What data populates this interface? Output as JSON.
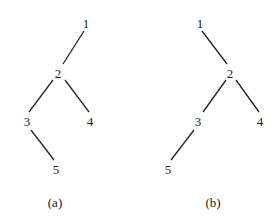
{
  "figure": {
    "trees": [
      {
        "caption": "(a)",
        "nodes": [
          {
            "id": "1",
            "label": "1",
            "x": 86,
            "y": 23
          },
          {
            "id": "2",
            "label": "2",
            "x": 58,
            "y": 73
          },
          {
            "id": "3",
            "label": "3",
            "x": 27,
            "y": 121
          },
          {
            "id": "4",
            "label": "4",
            "x": 90,
            "y": 121
          },
          {
            "id": "5",
            "label": "5",
            "x": 56,
            "y": 169
          }
        ],
        "edges": [
          [
            "1",
            "2"
          ],
          [
            "2",
            "3"
          ],
          [
            "2",
            "4"
          ],
          [
            "3",
            "5"
          ]
        ]
      },
      {
        "caption": "(b)",
        "nodes": [
          {
            "id": "1",
            "label": "1",
            "x": 200,
            "y": 23
          },
          {
            "id": "2",
            "label": "2",
            "x": 230,
            "y": 73
          },
          {
            "id": "3",
            "label": "3",
            "x": 198,
            "y": 121
          },
          {
            "id": "4",
            "label": "4",
            "x": 260,
            "y": 121
          },
          {
            "id": "5",
            "label": "5",
            "x": 168,
            "y": 169
          }
        ],
        "edges": [
          [
            "1",
            "2"
          ],
          [
            "2",
            "3"
          ],
          [
            "2",
            "4"
          ],
          [
            "3",
            "5"
          ]
        ]
      }
    ]
  }
}
